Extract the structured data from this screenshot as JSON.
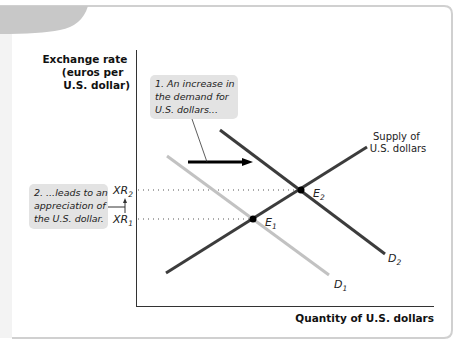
{
  "figure": {
    "y_axis_label": [
      "Exchange rate",
      "(euros per",
      "U.S. dollar)"
    ],
    "x_axis_label": "Quantity of U.S. dollars",
    "callouts": [
      {
        "id": "demand-increase",
        "lines": [
          "1. An increase in",
          "the demand for",
          "U.S. dollars..."
        ]
      },
      {
        "id": "appreciation",
        "lines": [
          "2. ...leads to an",
          "appreciation of",
          "the U.S. dollar."
        ]
      }
    ],
    "tick_labels": {
      "xr2": {
        "base": "XR",
        "sub": "2"
      },
      "xr1": {
        "base": "XR",
        "sub": "1"
      }
    },
    "curve_labels": {
      "supply": [
        "Supply of",
        "U.S. dollars"
      ],
      "d1": {
        "base": "D",
        "sub": "1"
      },
      "d2": {
        "base": "D",
        "sub": "2"
      }
    },
    "points": {
      "e1": {
        "base": "E",
        "sub": "1"
      },
      "e2": {
        "base": "E",
        "sub": "2"
      }
    },
    "colors": {
      "card_border": "#d0d0d0",
      "tab_gray": "#c8c8c8",
      "callout_bg": "#e3e3e3",
      "supply": "#3c3c3c",
      "d1": "#c2c2c2",
      "d2": "#3c3c3c",
      "axis": "#333333"
    }
  }
}
